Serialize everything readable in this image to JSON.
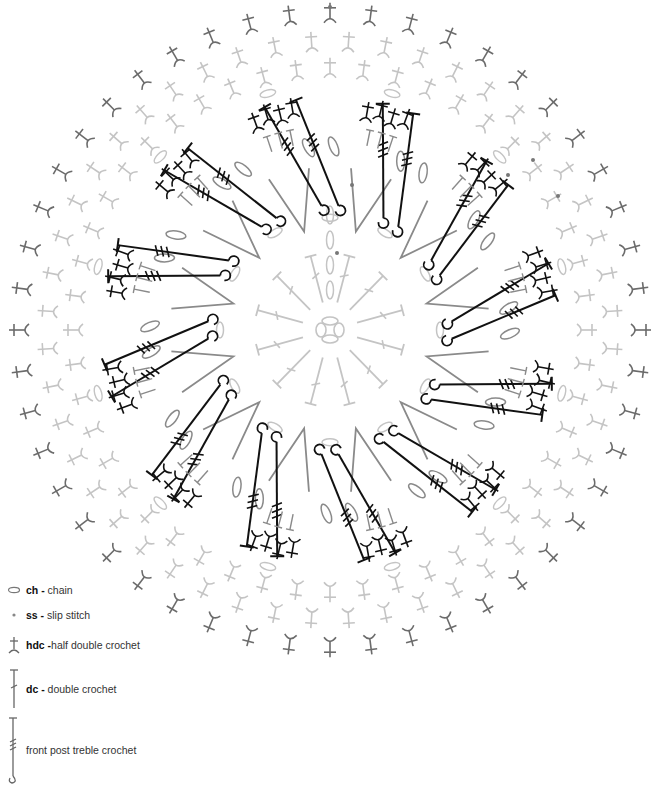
{
  "diagram": {
    "type": "crochet-chart",
    "center": {
      "x": 330,
      "y": 330
    },
    "colors": {
      "round_light": "#c4c4c4",
      "round_mid": "#8a8a8a",
      "round_dark": "#111111",
      "round_outer": "#6b6b6b"
    },
    "rounds": [
      {
        "round": 1,
        "stitch": "dc",
        "count": 12,
        "color": "round_light"
      },
      {
        "round": 2,
        "stitch": "dc-v",
        "count": 12,
        "color": "round_mid"
      },
      {
        "round": 3,
        "stitch": "fptr",
        "count": 24,
        "color": "round_dark"
      },
      {
        "round": 4,
        "stitch": "hdc-cluster",
        "count": 12,
        "color": "round_dark"
      },
      {
        "round": 5,
        "stitch": "hdc",
        "count": 48,
        "color": "round_light"
      },
      {
        "round": 6,
        "stitch": "hdc",
        "count": 48,
        "color": "round_light"
      },
      {
        "round": 7,
        "stitch": "hdc",
        "count": 48,
        "color": "round_outer"
      }
    ]
  },
  "legend": {
    "items": [
      {
        "symbol": "chain-icon",
        "abbr": "ch -",
        "label": " chain"
      },
      {
        "symbol": "slip-stitch-icon",
        "abbr": "ss -",
        "label": " slip stitch"
      },
      {
        "symbol": "hdc-icon",
        "abbr": "hdc -",
        "label": "half double crochet"
      },
      {
        "symbol": "dc-icon",
        "abbr": "dc -",
        "label": " double crochet"
      },
      {
        "symbol": "fptr-icon",
        "abbr": "",
        "label": "front post treble crochet"
      }
    ]
  }
}
